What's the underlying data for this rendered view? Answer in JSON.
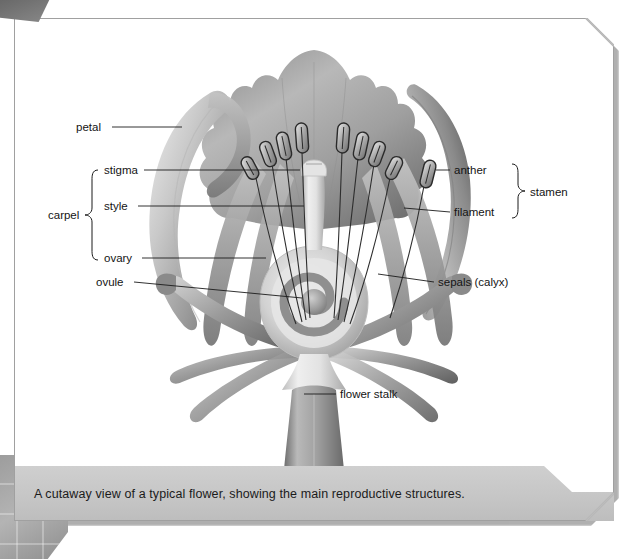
{
  "figure": {
    "caption": "A cutaway view of a typical flower, showing the main reproductive structures.",
    "style": "grayscale airbrush botanical illustration"
  },
  "colors": {
    "page_background": "#ffffff",
    "panel_border": "#a8a8a8",
    "caption_band": "#c6c6c6",
    "caption_text": "#1b1b1b",
    "leader_line": "#1b1b1b",
    "illustration_dark": "#4a4a4a",
    "illustration_mid": "#8f8f8f",
    "illustration_light": "#d8d8d8",
    "corner_tab": "#707070",
    "mosaic_block": "#a4a4a4"
  },
  "labels": {
    "petal": "petal",
    "stigma": "stigma",
    "style": "style",
    "ovary": "ovary",
    "ovule": "ovule",
    "carpel": "carpel",
    "anther": "anther",
    "filament": "filament",
    "stamen": "stamen",
    "sepals": "sepals (calyx)",
    "flower_stalk": "flower stalk"
  },
  "label_list": [
    {
      "name": "petal",
      "text": "petal",
      "side": "left",
      "group": null
    },
    {
      "name": "stigma",
      "text": "stigma",
      "side": "left",
      "group": "carpel"
    },
    {
      "name": "style",
      "text": "style",
      "side": "left",
      "group": "carpel"
    },
    {
      "name": "ovary",
      "text": "ovary",
      "side": "left",
      "group": "carpel"
    },
    {
      "name": "ovule",
      "text": "ovule",
      "side": "left",
      "group": null
    },
    {
      "name": "anther",
      "text": "anther",
      "side": "right",
      "group": "stamen"
    },
    {
      "name": "filament",
      "text": "filament",
      "side": "right",
      "group": "stamen"
    },
    {
      "name": "sepals",
      "text": "sepals (calyx)",
      "side": "right",
      "group": null
    },
    {
      "name": "flower-stalk",
      "text": "flower stalk",
      "side": "right",
      "group": null
    }
  ],
  "groups": [
    {
      "name": "carpel",
      "text": "carpel",
      "members": [
        "stigma",
        "style",
        "ovary"
      ],
      "side": "left"
    },
    {
      "name": "stamen",
      "text": "stamen",
      "members": [
        "anther",
        "filament"
      ],
      "side": "right"
    }
  ],
  "anatomy": {
    "anther_count": 9,
    "sepal_count": 6,
    "petal_count": 5,
    "ovule_count": 1
  }
}
